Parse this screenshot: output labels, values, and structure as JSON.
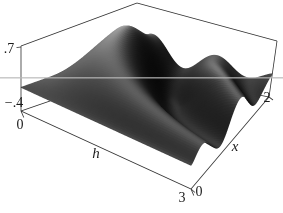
{
  "chart_data": {
    "type": "surface",
    "axes": {
      "h": {
        "label": "h",
        "min": 0,
        "max": 3,
        "tick_labels": [
          "0",
          "3"
        ]
      },
      "x": {
        "label": "x",
        "min": 0,
        "max": 2,
        "tick_labels": [
          "0",
          "2"
        ]
      },
      "z": {
        "min": -0.4,
        "max": 0.7,
        "tick_labels": [
          ".7",
          "−.4"
        ]
      }
    },
    "surface_model": {
      "formula": "z(h,x) = clamp( 0.78 * sin(2.2*x*h) * sqrt(x*(2.9-x)/2.1) * (1 - 0.6*smoothstep(1.35,2,x)) * exp(-0.35*h), -0.4, 0.7 )",
      "scale": 0.78,
      "freq": 2.2,
      "env_b": 2.9,
      "env_norm": 2.1,
      "taper_start": 1.35,
      "taper_end": 2.0,
      "taper_amount": 0.6,
      "decay": 0.35,
      "clamp_min": -0.4,
      "clamp_max": 0.7
    },
    "sample_grid": {
      "h": [
        0,
        0.75,
        1.5,
        2.25,
        3
      ],
      "x": [
        0,
        0.5,
        1,
        1.5,
        2
      ],
      "z_rows_by_h": [
        [
          0,
          0,
          0,
          0,
          0
        ],
        [
          0,
          0.33,
          0.57,
          0.34,
          -0.04
        ],
        [
          0,
          0.35,
          -0.07,
          -0.4,
          0.05
        ],
        [
          0,
          0.17,
          -0.33,
          0.29,
          -0.06
        ],
        [
          0,
          -0.03,
          0.08,
          -0.11,
          0.06
        ]
      ]
    },
    "legend": "none",
    "grid": "off"
  },
  "labels": {
    "z_max": ".7",
    "z_min": "−.4",
    "h_min": "0",
    "h_max": "3",
    "h_axis": "h",
    "x_min": "0",
    "x_max": "2",
    "x_axis": "x"
  },
  "projection": {
    "box_corners": {
      "A_bottom_h0_x0": [
        21,
        111
      ],
      "B_bottom_h3_x0": [
        191,
        189
      ],
      "C_bottom_h3_x2": [
        269,
        97
      ],
      "D_bottom_h0_x2": [
        137,
        71
      ],
      "A_top": [
        21,
        46
      ],
      "B_top": [
        191,
        124
      ],
      "C_top": [
        277,
        41
      ],
      "D_top": [
        137,
        3
      ]
    }
  },
  "style": {
    "background": "#ffffff",
    "edge_color": "#2f2f2f",
    "label_color": "#1b1b1b",
    "surface_ambient": 14,
    "surface_diffuse": 165,
    "shade_power": 1.8,
    "light_dir": [
      -0.42,
      0.08,
      0.9
    ],
    "world_scale": [
      1.0,
      0.66,
      0.33
    ],
    "ao_base": 0.32,
    "ao_range": 0.68,
    "ao_power": 1.2,
    "scanline": {
      "y": 77.8,
      "color": "rgba(185,185,185,0.85)",
      "width": 1.3
    }
  }
}
